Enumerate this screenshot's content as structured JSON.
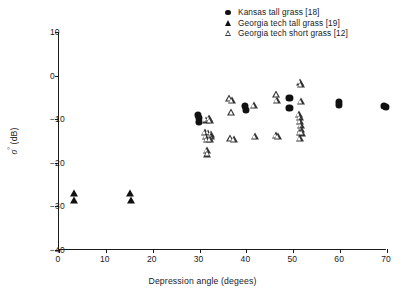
{
  "chart_data": {
    "type": "scatter",
    "title": "",
    "xlabel": "Depression angle (degees)",
    "ylabel_plain": "sigma-0 (dB)",
    "ylabel_symbol": "σ",
    "ylabel_superscript": "°",
    "ylabel_units": "(dB)",
    "xlim": [
      0,
      70
    ],
    "ylim": [
      -40,
      10
    ],
    "xticks": [
      0,
      10,
      20,
      30,
      40,
      50,
      60,
      70
    ],
    "yticks": [
      10,
      0,
      -10,
      -20,
      -30,
      -40
    ],
    "xtick_labels": [
      "0",
      "10",
      "20",
      "30",
      "40",
      "50",
      "60",
      "70"
    ],
    "ytick_labels": [
      "10",
      "0",
      "−10",
      "−20",
      "−30",
      "−40"
    ],
    "grid": false,
    "legend_position": "top-right",
    "series": [
      {
        "name": "Kansas tall grass [18]",
        "marker": "filled-circle",
        "color": "#111111",
        "points": [
          [
            29.9,
            -9.0
          ],
          [
            30.1,
            -9.8
          ],
          [
            30.0,
            -10.6
          ],
          [
            39.9,
            -7.0
          ],
          [
            40.2,
            -7.8
          ],
          [
            49.4,
            -5.2
          ],
          [
            49.4,
            -7.4
          ],
          [
            59.9,
            -6.0
          ],
          [
            60.0,
            -6.7
          ],
          [
            69.6,
            -7.0
          ],
          [
            70.0,
            -7.2
          ]
        ]
      },
      {
        "name": "Georgia tech tall grass [19]",
        "marker": "filled-triangle",
        "color": "#111111",
        "points": [
          [
            3.4,
            -26.9
          ],
          [
            3.4,
            -28.6
          ],
          [
            15.4,
            -26.9
          ],
          [
            15.5,
            -28.6
          ]
        ]
      },
      {
        "name": "Georgia tech short grass [12]",
        "marker": "open-triangle",
        "color": "#333333",
        "points": [
          [
            31.6,
            -10.1
          ],
          [
            32.2,
            -9.8
          ],
          [
            32.5,
            -10.2
          ],
          [
            31.4,
            -12.9
          ],
          [
            32.0,
            -13.1
          ],
          [
            32.6,
            -13.3
          ],
          [
            31.5,
            -13.8
          ],
          [
            32.1,
            -14.0
          ],
          [
            32.7,
            -13.9
          ],
          [
            31.8,
            -14.6
          ],
          [
            32.4,
            -14.5
          ],
          [
            31.7,
            -17.1
          ],
          [
            31.9,
            -17.9
          ],
          [
            36.6,
            -5.2
          ],
          [
            37.2,
            -5.7
          ],
          [
            37.0,
            -8.3
          ],
          [
            36.8,
            -14.3
          ],
          [
            37.5,
            -14.6
          ],
          [
            41.9,
            -6.8
          ],
          [
            42.0,
            -13.8
          ],
          [
            46.6,
            -4.2
          ],
          [
            46.8,
            -5.7
          ],
          [
            46.5,
            -13.6
          ],
          [
            47.0,
            -13.9
          ],
          [
            51.6,
            -1.4
          ],
          [
            51.8,
            -1.9
          ],
          [
            51.9,
            -5.9
          ],
          [
            51.5,
            -8.8
          ],
          [
            51.7,
            -9.6
          ],
          [
            51.6,
            -10.4
          ],
          [
            51.9,
            -11.3
          ],
          [
            51.8,
            -12.3
          ],
          [
            51.6,
            -12.9
          ],
          [
            52.0,
            -13.1
          ],
          [
            51.7,
            -14.3
          ]
        ]
      }
    ]
  }
}
